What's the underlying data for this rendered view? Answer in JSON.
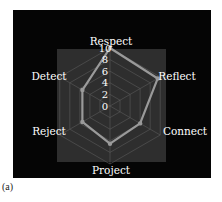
{
  "chart_data": {
    "type": "radar",
    "title": "",
    "categories": [
      "Respect",
      "Reflect",
      "Connect",
      "Project",
      "Reject",
      "Detect"
    ],
    "series": [
      {
        "name": "Series 1",
        "values": [
          10,
          9.5,
          6,
          6.5,
          5.5,
          5.5
        ]
      }
    ],
    "radial_ticks": [
      "0",
      "2",
      "4",
      "6",
      "8",
      "10"
    ],
    "rlim": [
      0,
      10
    ],
    "grid": true,
    "legend": "none",
    "colors": {
      "background": "#050505",
      "plot_area": "#2e2e2e",
      "grid": "#5a5a5a",
      "series_line": "#9a9a9a",
      "label_text": "#ffffff"
    }
  },
  "panel_label": "(a)"
}
